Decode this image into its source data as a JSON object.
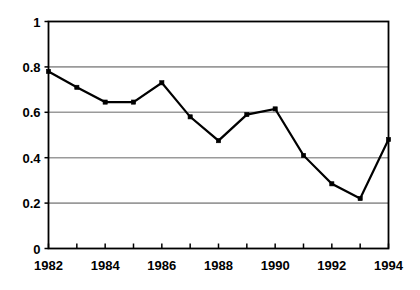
{
  "chart_data": {
    "type": "line",
    "title": "",
    "xlabel": "",
    "ylabel": "",
    "categories": [
      1982,
      1983,
      1984,
      1985,
      1986,
      1987,
      1988,
      1989,
      1990,
      1991,
      1992,
      1993,
      1994
    ],
    "x": [
      1982,
      1983,
      1984,
      1985,
      1986,
      1987,
      1988,
      1989,
      1990,
      1991,
      1992,
      1993,
      1994
    ],
    "values": [
      0.78,
      0.71,
      0.645,
      0.645,
      0.73,
      0.58,
      0.475,
      0.59,
      0.615,
      0.41,
      0.285,
      0.22,
      0.48
    ],
    "series": [
      {
        "name": "series-1",
        "values": [
          0.78,
          0.71,
          0.645,
          0.645,
          0.73,
          0.58,
          0.475,
          0.59,
          0.615,
          0.41,
          0.285,
          0.22,
          0.48
        ]
      }
    ],
    "xlim": [
      1982,
      1994
    ],
    "ylim": [
      0,
      1
    ],
    "y_ticks": [
      0,
      0.2,
      0.4,
      0.6,
      0.8,
      1
    ],
    "y_tick_labels": [
      "0",
      "0.2",
      "0.4",
      "0.6",
      "0.8",
      "1"
    ],
    "x_ticks": [
      1982,
      1983,
      1984,
      1985,
      1986,
      1987,
      1988,
      1989,
      1990,
      1991,
      1992,
      1993,
      1994
    ],
    "x_tick_labels": [
      "1982",
      "",
      "1984",
      "",
      "1986",
      "",
      "1988",
      "",
      "1990",
      "",
      "1992",
      "",
      "1994"
    ],
    "x_labeled_ticks": [
      "1982",
      "1984",
      "1986",
      "1988",
      "1990",
      "1992",
      "1994"
    ],
    "grid": "horizontal",
    "legend": "none",
    "marker": "square",
    "colors": {
      "line": "#000000",
      "marker": "#000000",
      "gridline": "#9a9a9a",
      "axis": "#000000",
      "background": "#ffffff",
      "text": "#000000"
    }
  }
}
